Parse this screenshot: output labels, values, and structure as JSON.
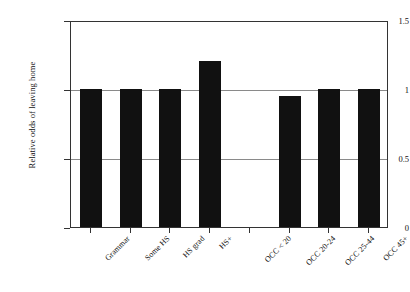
{
  "chart_data": {
    "type": "bar",
    "title": "",
    "subtitle": "",
    "xlabel": "",
    "ylabel": "Relative odds of leaving home",
    "categories": [
      "Grammar",
      "Some HS",
      "HS grad",
      "HS+",
      "OCC < 20",
      "OCC 20-24",
      "OCC 25-44",
      "OCC 45+"
    ],
    "values": [
      1,
      1,
      1,
      1.2,
      0,
      0.95,
      1,
      1
    ],
    "ylim": [
      0,
      1.5
    ],
    "yticks": [
      "0",
      "0.5",
      "1",
      "1.5"
    ],
    "ytick_values": [
      0,
      0.5,
      1,
      1.5
    ],
    "grid": "horizontal gridlines at 0.5 and 1",
    "gridline_values": [
      0.5,
      1
    ],
    "legend": "none",
    "legend_position": "none",
    "bar_color": "#111111",
    "plot_background": "#ffffff",
    "axis_color": "#333333",
    "gridline_color": "#8a8a8a",
    "annotations": "OCC < 20 category has no bar (reference/zero)"
  }
}
